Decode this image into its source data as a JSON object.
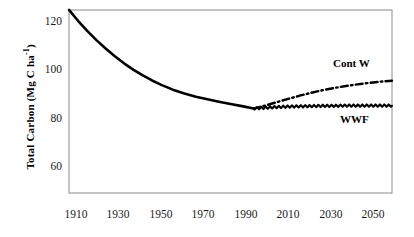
{
  "chart_data": {
    "type": "line",
    "title": "",
    "xlabel": "",
    "ylabel": "Total Carbon (Mg C ha-1)",
    "ylabel_parts": {
      "main": "Total Carbon (Mg C ha",
      "sup": "-1",
      "tail": ")"
    },
    "xlim": [
      1910,
      2050
    ],
    "ylim": [
      50,
      128
    ],
    "xticks": [
      1910,
      1930,
      1950,
      1970,
      1990,
      2010,
      2030,
      2050
    ],
    "yticks": [
      60,
      80,
      100,
      120
    ],
    "grid": false,
    "legend_position": "inline-right",
    "series": [
      {
        "name": "Historical",
        "style": "solid",
        "color": "#000000",
        "x": [
          1910,
          1914,
          1918,
          1922,
          1926,
          1930,
          1934,
          1938,
          1942,
          1946,
          1950,
          1955,
          1960,
          1965,
          1970,
          1975,
          1980,
          1985,
          1990
        ],
        "values": [
          125.0,
          120.4,
          116.2,
          112.4,
          108.9,
          105.7,
          102.8,
          100.2,
          97.9,
          95.8,
          94.0,
          92.0,
          90.4,
          89.1,
          88.0,
          87.0,
          86.1,
          85.2,
          84.2
        ]
      },
      {
        "name": "Cont W",
        "style": "dash-dot",
        "color": "#000000",
        "x": [
          1990,
          1995,
          2000,
          2005,
          2010,
          2015,
          2020,
          2025,
          2030,
          2035,
          2040,
          2045,
          2050
        ],
        "values": [
          84.2,
          85.4,
          86.8,
          88.2,
          89.5,
          90.7,
          91.8,
          92.7,
          93.5,
          94.2,
          94.8,
          95.3,
          95.7
        ]
      },
      {
        "name": "WWF",
        "style": "solid-wavy",
        "color": "#000000",
        "x": [
          1990,
          1995,
          2000,
          2005,
          2010,
          2015,
          2020,
          2025,
          2030,
          2035,
          2040,
          2045,
          2050
        ],
        "values": [
          84.2,
          84.5,
          84.8,
          85.0,
          85.1,
          85.2,
          85.3,
          85.3,
          85.4,
          85.4,
          85.4,
          85.4,
          85.4
        ]
      }
    ],
    "annotations": [
      {
        "text": "Cont W",
        "x": 2032,
        "y": 101
      },
      {
        "text": "WWF",
        "x": 2034,
        "y": 78
      }
    ]
  }
}
